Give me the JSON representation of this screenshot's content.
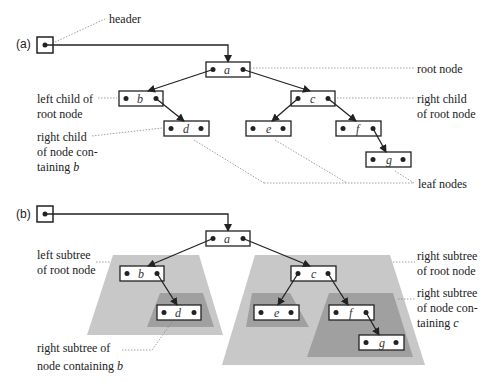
{
  "panel_a": {
    "label": "(a)",
    "header_label": "header",
    "annotations": {
      "root_node": "root node",
      "left_child_1": "left child of",
      "left_child_2": "root node",
      "right_child_1": "right child",
      "right_child_2": "of root node",
      "right_child_b_1": "right child",
      "right_child_b_2": "of node con-",
      "right_child_b_3": "taining ",
      "right_child_b_var": "b",
      "leaf_nodes": "leaf nodes"
    },
    "nodes": {
      "a": "a",
      "b": "b",
      "c": "c",
      "d": "d",
      "e": "e",
      "f": "f",
      "g": "g"
    }
  },
  "panel_b": {
    "label": "(b)",
    "annotations": {
      "left_subtree_1": "left subtree",
      "left_subtree_2": "of root node",
      "right_subtree_1": "right subtree",
      "right_subtree_2": "of root node",
      "right_subtree_c_1": "right subtree",
      "right_subtree_c_2": "of node con-",
      "right_subtree_c_3": "taining ",
      "right_subtree_c_var": "c",
      "right_subtree_b_1": "right subtree of",
      "right_subtree_b_2": "node containing ",
      "right_subtree_b_var": "b"
    },
    "nodes": {
      "a": "a",
      "b": "b",
      "c": "c",
      "d": "d",
      "e": "e",
      "f": "f",
      "g": "g"
    }
  },
  "colors": {
    "light_subtree": "#c8c8c8",
    "dark_subtree": "#a0a0a0",
    "line": "#222222",
    "leader": "#888888"
  }
}
